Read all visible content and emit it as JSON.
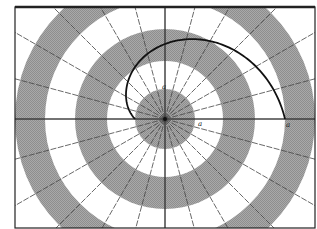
{
  "diagram": {
    "type": "polar-grid-with-spiral",
    "frame": {
      "x": 15,
      "y": 7,
      "width": 300,
      "height": 221,
      "stroke": "#222222",
      "top_stroke_width": 2.5,
      "stroke_width": 1.2
    },
    "center": {
      "x": 165,
      "y": 119
    },
    "colors": {
      "background": "#ffffff",
      "band_gray": "#a9a9a9",
      "band_white": "#ffffff",
      "radial_line": "#444444",
      "axis_line": "#333333",
      "spiral": "#111111",
      "label": "#222222"
    },
    "bands": [
      {
        "r_inner": 0,
        "r_outer": 30,
        "fill": "gray"
      },
      {
        "r_inner": 30,
        "r_outer": 58,
        "fill": "white"
      },
      {
        "r_inner": 58,
        "r_outer": 90,
        "fill": "gray"
      },
      {
        "r_inner": 90,
        "r_outer": 120,
        "fill": "white"
      },
      {
        "r_inner": 120,
        "r_outer": 150,
        "fill": "gray"
      },
      {
        "r_inner": 150,
        "r_outer": 260,
        "fill": "white"
      }
    ],
    "radial_count": 24,
    "radial_step_deg": 15,
    "spiral": {
      "description": "Archimedean spiral from angle 180deg (r=30) to 360deg (r=120)",
      "r_start": 30,
      "r_end": 120,
      "theta_start_deg": 180,
      "theta_end_deg": 360,
      "stroke_width": 1.8
    },
    "labels": [
      {
        "text": "a",
        "x": 162,
        "y": 89
      },
      {
        "text": "a",
        "x": 198,
        "y": 126
      },
      {
        "text": "a",
        "x": 286,
        "y": 127
      }
    ]
  }
}
